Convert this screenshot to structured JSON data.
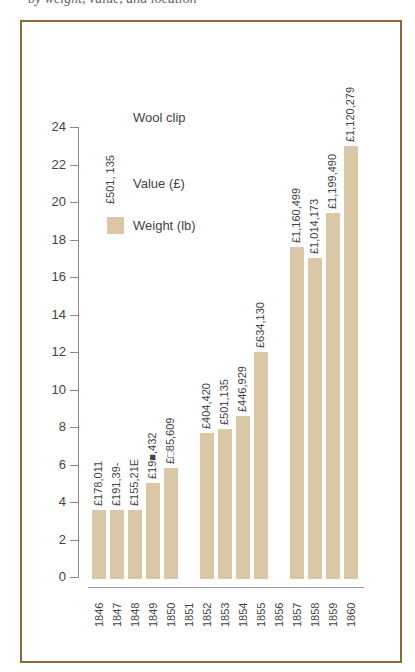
{
  "page": {
    "top_text_fragment": "by weight, value, and location"
  },
  "chart_data": {
    "type": "bar",
    "title": "Wool clip",
    "legend": {
      "value_label": "Value (£)",
      "value_sample": "£501, 135",
      "weight_label": "Weight (lb)"
    },
    "xlabel": "",
    "ylabel": "",
    "ylim": [
      0,
      24
    ],
    "yticks": [
      0,
      2,
      4,
      6,
      8,
      10,
      12,
      14,
      16,
      18,
      20,
      22,
      24
    ],
    "categories": [
      "1846",
      "1847",
      "1848",
      "1849",
      "1850",
      "1851",
      "1852",
      "1853",
      "1854",
      "1855",
      "1856",
      "1857",
      "1858",
      "1859",
      "1860"
    ],
    "series": [
      {
        "name": "Weight (lb)",
        "values": [
          3.6,
          3.6,
          3.6,
          5.0,
          5.8,
          null,
          7.7,
          7.9,
          8.6,
          12.0,
          null,
          17.6,
          17.0,
          19.4,
          23.0
        ]
      }
    ],
    "value_labels": [
      "£178,011",
      "£191,39-",
      "£155,21E",
      "£19■,432",
      "£□85,609",
      "",
      "£404,420",
      "£501,135",
      "£446,929",
      "£634,130",
      "",
      "£1,160,499",
      "£1,014,173",
      "£1,199,490",
      "£1,120,279"
    ],
    "grid": false,
    "legend_position": "top-left",
    "bar_color": "#d9c7a6",
    "frame_color": "#8a6a3a"
  }
}
